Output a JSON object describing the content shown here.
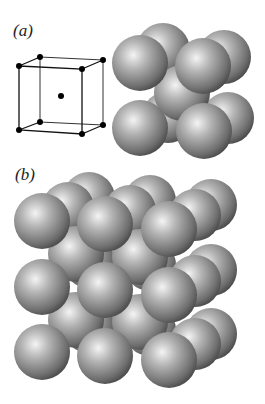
{
  "figure": {
    "panel_a": {
      "label": "(a)",
      "description": "Body-centered cubic unit cell: lattice points and hard-sphere model",
      "cube_corners": [
        [
          19,
          66
        ],
        [
          40,
          57
        ],
        [
          103,
          60
        ],
        [
          82,
          69
        ],
        [
          19,
          130
        ],
        [
          40,
          122
        ],
        [
          103,
          125
        ],
        [
          82,
          134
        ]
      ],
      "body_center": [
        61,
        96
      ],
      "spheres": [
        {
          "cx": 163,
          "cy": 50,
          "r": 27
        },
        {
          "cx": 224,
          "cy": 57,
          "r": 27
        },
        {
          "cx": 168,
          "cy": 117,
          "r": 26
        },
        {
          "cx": 228,
          "cy": 118,
          "r": 26
        },
        {
          "cx": 182,
          "cy": 93,
          "r": 28
        },
        {
          "cx": 140,
          "cy": 63,
          "r": 28
        },
        {
          "cx": 203,
          "cy": 66,
          "r": 28
        },
        {
          "cx": 140,
          "cy": 127,
          "r": 28
        },
        {
          "cx": 204,
          "cy": 131,
          "r": 28
        }
      ]
    },
    "panel_b": {
      "label": "(b)",
      "description": "Extended BCC lattice of packed spheres (3x3x? arrangement)"
    },
    "colors": {
      "sphere_light": "#f2f2f2",
      "sphere_mid": "#9a9a9a",
      "sphere_dark": "#4a4a4a",
      "line": "#111111"
    }
  }
}
